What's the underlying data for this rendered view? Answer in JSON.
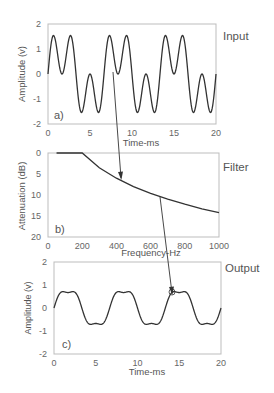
{
  "chart_data": [
    {
      "type": "line",
      "panel_label": "a)",
      "title": "Input",
      "xlabel": "Time-ms",
      "ylabel": "Amplitude (v)",
      "xlim": [
        0,
        20
      ],
      "ylim": [
        -2,
        2
      ],
      "xticks": [
        "0",
        "5",
        "10",
        "15",
        "20"
      ],
      "yticks": [
        "2",
        "1",
        "0",
        "-1",
        "-2"
      ],
      "grid": false,
      "description": "Sum of fundamental (150 Hz) and equal-amplitude 3rd harmonic (450 Hz): y = sin(wt) + sin(3wt), peaks ~±1.5",
      "series": [
        {
          "name": "input",
          "fundamental_hz": 150,
          "harmonic3_amplitude": 1.0,
          "amplitude": 1.0
        }
      ]
    },
    {
      "type": "line",
      "panel_label": "b)",
      "title": "Filter",
      "xlabel": "Frequency-Hz",
      "ylabel": "Attenuation (dB)",
      "xlim": [
        0,
        1000
      ],
      "ylim": [
        0,
        20
      ],
      "y_inverted": true,
      "xticks": [
        "0",
        "200",
        "400",
        "600",
        "800",
        "1000"
      ],
      "yticks": [
        "0",
        "5",
        "10",
        "15",
        "20"
      ],
      "grid": false,
      "x": [
        50,
        100,
        200,
        300,
        400,
        500,
        600,
        700,
        800,
        900,
        1000
      ],
      "values": [
        0,
        0,
        0,
        3.5,
        6.0,
        8.0,
        9.6,
        11.0,
        12.2,
        13.3,
        14.2
      ]
    },
    {
      "type": "line",
      "panel_label": "c)",
      "title": "Output",
      "xlabel": "Time-ms",
      "ylabel": "Amplitude (v)",
      "xlim": [
        0,
        20
      ],
      "ylim": [
        -2,
        2
      ],
      "xticks": [
        "0",
        "5",
        "10",
        "15",
        "20"
      ],
      "yticks": [
        "2",
        "1",
        "0",
        "-1",
        "-2"
      ],
      "grid": false,
      "description": "Filtered output: fundamental passes, 3rd harmonic attenuated; flat-topped wave peaking ~±0.9",
      "series": [
        {
          "name": "output",
          "fundamental_hz": 150,
          "harmonic3_amplitude": 0.18,
          "amplitude": 0.82
        }
      ]
    }
  ],
  "annotations": [
    {
      "type": "arrow",
      "from": "panel a (t≈9.5 ms)",
      "to": "filter curve at ~450 Hz"
    },
    {
      "type": "arrow",
      "from": "filter curve at ~650 Hz",
      "to": "panel c (t≈14.5 ms)"
    }
  ]
}
